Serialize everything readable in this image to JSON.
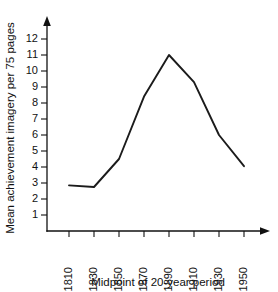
{
  "chart_data": {
    "type": "line",
    "title": "",
    "xlabel": "Midpoint of 20-year period",
    "ylabel": "Mean achievement imagery per 75 pages",
    "categories": [
      "1810",
      "1830",
      "1850",
      "1870",
      "1890",
      "1910",
      "1930",
      "1950"
    ],
    "x": [
      1810,
      1830,
      1850,
      1870,
      1890,
      1910,
      1930,
      1950
    ],
    "values": [
      2.85,
      2.75,
      4.5,
      8.4,
      11.0,
      9.3,
      6.0,
      4.05
    ],
    "series": [
      {
        "name": "Mean achievement imagery",
        "values": [
          2.85,
          2.75,
          4.5,
          8.4,
          11.0,
          9.3,
          6.0,
          4.05
        ]
      }
    ],
    "ytick_labels": [
      "1",
      "2",
      "3",
      "4",
      "5",
      "6",
      "7",
      "8",
      "9",
      "10",
      "11",
      "12"
    ],
    "ytick_values": [
      1,
      2,
      3,
      4,
      5,
      6,
      7,
      8,
      9,
      10,
      11,
      12
    ],
    "ylim": [
      0,
      12.6
    ],
    "xlim": [
      1800,
      1962
    ],
    "grid": false,
    "legend": false,
    "legend_position": "none",
    "line_color": "#1b1b1b",
    "axis_color": "#111111",
    "background_color": "#ffffff",
    "x_axis_arrow": true,
    "y_axis_arrow": true,
    "xtick_label_rotation": -90,
    "annotations": []
  }
}
